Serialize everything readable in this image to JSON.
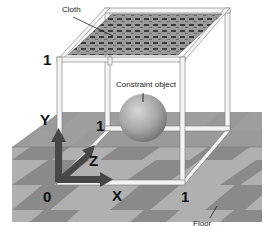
{
  "diagram": {
    "labels": {
      "cloth": "Cloth",
      "constraint_object": "Constraint object",
      "floor": "Floor"
    },
    "axes": {
      "y": "Y",
      "z": "Z",
      "x": "X",
      "origin": "0",
      "y_max": "1",
      "z_max": "1",
      "x_max": "1"
    },
    "colors": {
      "axis": "#4a4a4a",
      "frame": "#f2f2f2",
      "floor_light": "#bdbdbd",
      "floor_dark": "#8c8c8c",
      "sphere": "#a8a8a8",
      "cloth_dark": "#404040",
      "cloth_light": "#a0a0a0"
    }
  }
}
